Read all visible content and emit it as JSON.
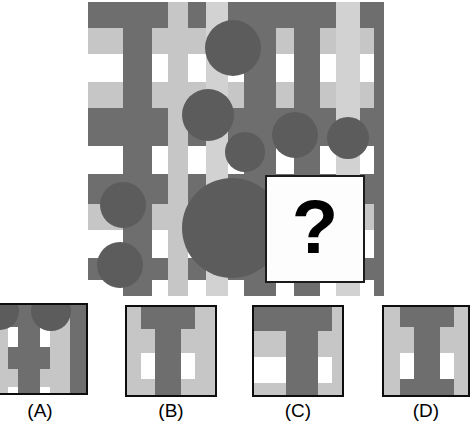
{
  "puzzle": {
    "type": "visual-pattern-matrix-completion",
    "question_mark": "?",
    "palette": {
      "dark_gray": "#6e6e6e",
      "mid_gray": "#7b7b7b",
      "light_gray": "#c6c6c6",
      "pale_gray": "#d2d2d2",
      "white": "#ffffff",
      "circle": "#5c5c5c",
      "circle_dark": "#585858",
      "border": "#0d0d0d",
      "qbox_bg": "#fdfdfd",
      "qmark_color": "#000000"
    },
    "main_panel": {
      "x": 88,
      "y": 2,
      "width": 296,
      "height": 294,
      "horizontal_bands": [
        {
          "y": 0,
          "h": 26,
          "color": "#6e6e6e"
        },
        {
          "y": 26,
          "h": 26,
          "color": "#c6c6c6"
        },
        {
          "y": 52,
          "h": 28,
          "color": "#ffffff"
        },
        {
          "y": 80,
          "h": 26,
          "color": "#c6c6c6"
        },
        {
          "y": 106,
          "h": 38,
          "color": "#6e6e6e"
        },
        {
          "y": 144,
          "h": 28,
          "color": "#ffffff"
        },
        {
          "y": 172,
          "h": 30,
          "color": "#6e6e6e"
        },
        {
          "y": 202,
          "h": 26,
          "color": "#c6c6c6"
        },
        {
          "y": 228,
          "h": 28,
          "color": "#ffffff"
        },
        {
          "y": 256,
          "h": 22,
          "color": "#6e6e6e"
        },
        {
          "y": 278,
          "h": 16,
          "color": "#ffffff"
        }
      ],
      "vertical_stripes": [
        {
          "x": 0,
          "w": 35,
          "color": "#6e6e6e",
          "opacity": 0
        },
        {
          "x": 35,
          "w": 29,
          "color": "#6e6e6e",
          "opacity": 1
        },
        {
          "x": 64,
          "w": 16,
          "color": "#ffffff",
          "opacity": 0
        },
        {
          "x": 80,
          "w": 20,
          "color": "#c6c6c6",
          "opacity": 1
        },
        {
          "x": 100,
          "w": 18,
          "color": "#ffffff",
          "opacity": 0
        },
        {
          "x": 118,
          "w": 22,
          "color": "#d2d2d2",
          "opacity": 1
        },
        {
          "x": 140,
          "w": 16,
          "color": "#ffffff",
          "opacity": 0
        },
        {
          "x": 156,
          "w": 32,
          "color": "#6e6e6e",
          "opacity": 1
        },
        {
          "x": 188,
          "w": 18,
          "color": "#ffffff",
          "opacity": 0
        },
        {
          "x": 206,
          "w": 26,
          "color": "#6e6e6e",
          "opacity": 1
        },
        {
          "x": 232,
          "w": 16,
          "color": "#ffffff",
          "opacity": 0
        },
        {
          "x": 248,
          "w": 24,
          "color": "#d2d2d2",
          "opacity": 1
        },
        {
          "x": 272,
          "w": 14,
          "color": "#ffffff",
          "opacity": 0
        },
        {
          "x": 286,
          "w": 10,
          "color": "#6e6e6e",
          "opacity": 1
        }
      ],
      "circles": [
        {
          "cx": 145,
          "cy": 46,
          "r": 28
        },
        {
          "cx": 120,
          "cy": 113,
          "r": 26
        },
        {
          "cx": 157,
          "cy": 150,
          "r": 20
        },
        {
          "cx": 207,
          "cy": 133,
          "r": 23
        },
        {
          "cx": 260,
          "cy": 136,
          "r": 21
        },
        {
          "cx": 35,
          "cy": 203,
          "r": 23
        },
        {
          "cx": 144,
          "cy": 226,
          "r": 50
        },
        {
          "cx": 32,
          "cy": 263,
          "r": 23
        }
      ],
      "question_box": {
        "x": 177,
        "y": 173,
        "width": 96,
        "height": 104
      }
    },
    "options": [
      {
        "id": "A",
        "label": "(A)",
        "x": -8,
        "y": 303,
        "width": 96,
        "height": 92,
        "label_y": 400,
        "has_circles": true,
        "horizontal_bands": [
          {
            "y": 0,
            "h": 22,
            "color": "#6e6e6e"
          },
          {
            "y": 22,
            "h": 20,
            "color": "#ffffff"
          },
          {
            "y": 42,
            "h": 22,
            "color": "#6e6e6e"
          },
          {
            "y": 64,
            "h": 18,
            "color": "#c6c6c6"
          },
          {
            "y": 82,
            "h": 14,
            "color": "#ffffff"
          }
        ],
        "vertical_stripes": [
          {
            "x": 0,
            "w": 14,
            "color": "#c6c6c6",
            "opacity": 1
          },
          {
            "x": 14,
            "w": 10,
            "color": "#ffffff",
            "opacity": 0
          },
          {
            "x": 24,
            "w": 22,
            "color": "#6e6e6e",
            "opacity": 1
          },
          {
            "x": 46,
            "w": 10,
            "color": "#ffffff",
            "opacity": 0
          },
          {
            "x": 56,
            "w": 20,
            "color": "#c6c6c6",
            "opacity": 1
          },
          {
            "x": 76,
            "w": 20,
            "color": "#6e6e6e",
            "opacity": 1
          }
        ],
        "circles": [
          {
            "cx": 6,
            "cy": 6,
            "r": 19
          },
          {
            "cx": 57,
            "cy": 6,
            "r": 20
          }
        ]
      },
      {
        "id": "B",
        "label": "(B)",
        "x": 125,
        "y": 305,
        "width": 92,
        "height": 92,
        "label_y": 400,
        "has_circles": false,
        "horizontal_bands": [
          {
            "y": 0,
            "h": 22,
            "color": "#6e6e6e"
          },
          {
            "y": 22,
            "h": 24,
            "color": "#c6c6c6"
          },
          {
            "y": 46,
            "h": 26,
            "color": "#ffffff"
          },
          {
            "y": 72,
            "h": 20,
            "color": "#c6c6c6"
          }
        ],
        "vertical_stripes": [
          {
            "x": 0,
            "w": 14,
            "color": "#c6c6c6",
            "opacity": 1
          },
          {
            "x": 14,
            "w": 14,
            "color": "#ffffff",
            "opacity": 0
          },
          {
            "x": 28,
            "w": 26,
            "color": "#6e6e6e",
            "opacity": 1
          },
          {
            "x": 54,
            "w": 14,
            "color": "#ffffff",
            "opacity": 0
          },
          {
            "x": 68,
            "w": 24,
            "color": "#c6c6c6",
            "opacity": 1
          }
        ],
        "circles": []
      },
      {
        "id": "C",
        "label": "(C)",
        "x": 252,
        "y": 305,
        "width": 92,
        "height": 92,
        "label_y": 400,
        "has_circles": false,
        "horizontal_bands": [
          {
            "y": 0,
            "h": 24,
            "color": "#6e6e6e"
          },
          {
            "y": 24,
            "h": 26,
            "color": "#c6c6c6"
          },
          {
            "y": 50,
            "h": 26,
            "color": "#ffffff"
          },
          {
            "y": 76,
            "h": 16,
            "color": "#c6c6c6"
          }
        ],
        "vertical_stripes": [
          {
            "x": 0,
            "w": 32,
            "color": "#ffffff",
            "opacity": 0
          },
          {
            "x": 32,
            "w": 32,
            "color": "#6e6e6e",
            "opacity": 1
          },
          {
            "x": 64,
            "w": 14,
            "color": "#ffffff",
            "opacity": 0
          },
          {
            "x": 78,
            "w": 14,
            "color": "#c6c6c6",
            "opacity": 1
          }
        ],
        "circles": []
      },
      {
        "id": "D",
        "label": "(D)",
        "x": 382,
        "y": 305,
        "width": 88,
        "height": 92,
        "label_y": 400,
        "has_circles": false,
        "horizontal_bands": [
          {
            "y": 0,
            "h": 20,
            "color": "#6e6e6e"
          },
          {
            "y": 20,
            "h": 26,
            "color": "#c6c6c6"
          },
          {
            "y": 46,
            "h": 26,
            "color": "#ffffff"
          },
          {
            "y": 72,
            "h": 20,
            "color": "#6e6e6e"
          }
        ],
        "vertical_stripes": [
          {
            "x": 0,
            "w": 16,
            "color": "#c6c6c6",
            "opacity": 1
          },
          {
            "x": 16,
            "w": 14,
            "color": "#ffffff",
            "opacity": 0
          },
          {
            "x": 30,
            "w": 26,
            "color": "#6e6e6e",
            "opacity": 1
          },
          {
            "x": 56,
            "w": 14,
            "color": "#ffffff",
            "opacity": 0
          },
          {
            "x": 70,
            "w": 18,
            "color": "#c6c6c6",
            "opacity": 1
          }
        ],
        "circles": []
      }
    ]
  }
}
